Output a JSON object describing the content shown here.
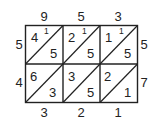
{
  "diagram": {
    "type": "lattice-multiplication",
    "top_digits": [
      "9",
      "5",
      "3"
    ],
    "left_digits": [
      "5",
      "4"
    ],
    "right_digits": [
      "5",
      "7"
    ],
    "bottom_digits": [
      "3",
      "2",
      "1"
    ],
    "cells": [
      [
        {
          "tens": "4",
          "ones": "5",
          "carry": "1"
        },
        {
          "tens": "2",
          "ones": "5",
          "carry": "1"
        },
        {
          "tens": "1",
          "ones": "5",
          "carry": "1"
        }
      ],
      [
        {
          "tens": "6",
          "ones": "3",
          "carry": ""
        },
        {
          "tens": "3",
          "ones": "5",
          "carry": ""
        },
        {
          "tens": "2",
          "ones": "1",
          "carry": ""
        }
      ]
    ]
  }
}
